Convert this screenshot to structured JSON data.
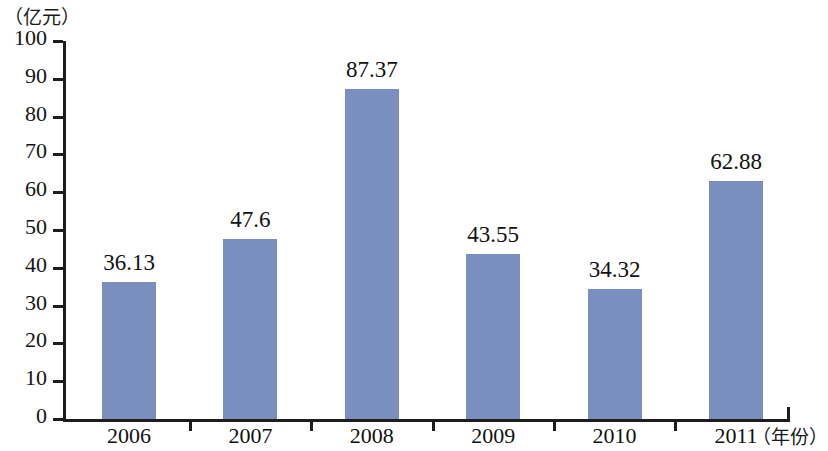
{
  "chart_data": {
    "type": "bar",
    "title": "",
    "subtitle": "",
    "categories": [
      "2006",
      "2007",
      "2008",
      "2009",
      "2010",
      "2011"
    ],
    "values": [
      36.13,
      47.6,
      87.37,
      43.55,
      34.32,
      62.88
    ],
    "value_labels": [
      "36.13",
      "47.6",
      "87.37",
      "43.55",
      "34.32",
      "62.88"
    ],
    "xlabel": "（年份）",
    "ylabel": "（亿元）",
    "ylim": [
      0,
      100
    ],
    "y_ticks": [
      0,
      10,
      20,
      30,
      40,
      50,
      60,
      70,
      80,
      90,
      100
    ],
    "y_tick_labels": [
      "0",
      "10",
      "20",
      "30",
      "40",
      "50",
      "60",
      "70",
      "80",
      "90",
      "100"
    ],
    "grid": false,
    "legend": null,
    "series": [
      {
        "name": "",
        "values": [
          36.13,
          47.6,
          87.37,
          43.55,
          34.32,
          62.88
        ],
        "color": "#7a8fbd"
      }
    ]
  },
  "style": {
    "bar_color": "#7a8fbd",
    "axis_color": "#1d1d1d",
    "text_color": "#111111",
    "background": "#ffffff"
  }
}
